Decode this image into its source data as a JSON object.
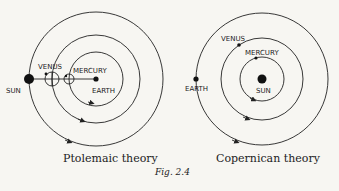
{
  "figure": {
    "caption": "Fig. 2.4"
  },
  "ptolemaic": {
    "title": "Ptolemaic theory",
    "labels": {
      "sun": "SUN",
      "venus": "VENUS",
      "mercury": "MERCURY",
      "earth": "EARTH"
    }
  },
  "copernican": {
    "title": "Copernican theory",
    "labels": {
      "sun": "SUN",
      "venus": "VENUS",
      "mercury": "MERCURY",
      "earth": "EARTH"
    }
  },
  "colors": {
    "ink": "#222222",
    "paper": "#f7f6f2"
  }
}
